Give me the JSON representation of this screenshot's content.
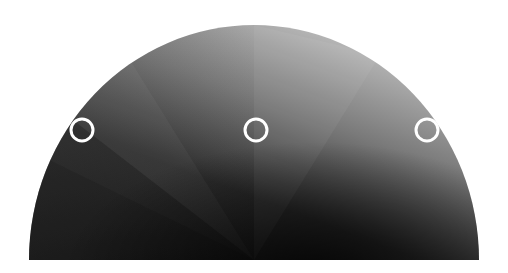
{
  "diagram": {
    "shape": "semicircle-dome",
    "fill": "grayscale radial/conic gradient, dark lower-left to light upper-right",
    "colors": {
      "background": "#ffffff",
      "darkest": "#0a0a0a",
      "mid": "#6e6e6e",
      "lightest": "#e6e6e6",
      "marker_stroke": "#ffffff"
    },
    "markers": [
      {
        "name": "left-marker",
        "cx": 82,
        "cy": 130,
        "r": 11
      },
      {
        "name": "center-marker",
        "cx": 256,
        "cy": 130,
        "r": 11
      },
      {
        "name": "right-marker",
        "cx": 427,
        "cy": 130,
        "r": 11
      }
    ]
  }
}
